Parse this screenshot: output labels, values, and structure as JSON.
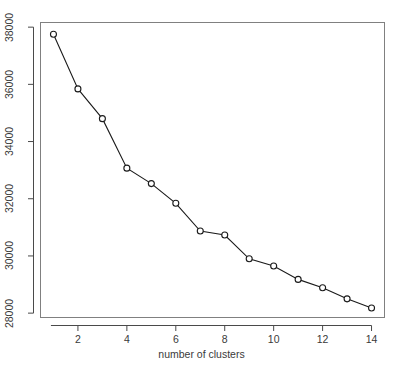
{
  "chart_data": {
    "type": "line",
    "title": "",
    "xlabel": "number of clusters",
    "ylabel": "",
    "x": [
      1,
      2,
      3,
      4,
      5,
      6,
      7,
      8,
      9,
      10,
      11,
      12,
      13,
      14
    ],
    "values": [
      37750,
      35840,
      34800,
      33070,
      32530,
      31840,
      30870,
      30730,
      29900,
      29650,
      29180,
      28890,
      28500,
      28180
    ],
    "series": [
      {
        "name": "within-cluster sum of squares",
        "values": [
          37750,
          35840,
          34800,
          33070,
          32530,
          31840,
          30870,
          30730,
          29900,
          29650,
          29180,
          28890,
          28500,
          28180
        ]
      }
    ],
    "xlim": [
      0.45,
      14.55
    ],
    "ylim": [
      27830,
      38180
    ],
    "xticks": [
      2,
      4,
      6,
      8,
      10,
      12,
      14
    ],
    "xtick_labels": [
      "2",
      "4",
      "6",
      "8",
      "10",
      "12",
      "14"
    ],
    "yticks": [
      28000,
      30000,
      32000,
      34000,
      36000,
      38000
    ],
    "ytick_labels": [
      "28000",
      "30000",
      "32000",
      "34000",
      "36000",
      "38000"
    ],
    "grid": false,
    "legend": null,
    "legend_position": "none",
    "marker": "open-circle",
    "line_color": "#1a1a1a",
    "marker_color": "#1a1a1a",
    "frame_color": "#808080",
    "background_color": "#ffffff"
  },
  "figure": {
    "cropped_title_text": "",
    "axis_label_color": "#3a3a3a"
  }
}
